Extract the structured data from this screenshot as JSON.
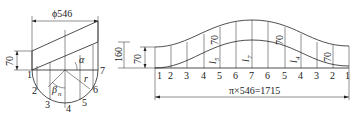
{
  "left_view": {
    "diameter_label": "ϕ546",
    "height_label": "70",
    "angle_alpha": "α",
    "angle_beta": "β",
    "angle_beta_sub": "n",
    "radius_label": "r",
    "points": [
      "1",
      "2",
      "3",
      "4",
      "5",
      "6",
      "7"
    ]
  },
  "development": {
    "height_outer_label": "160",
    "height_inner_label": "70",
    "points": [
      "1",
      "2",
      "3",
      "4",
      "5",
      "6",
      "7",
      "6",
      "5",
      "4",
      "3",
      "2",
      "1"
    ],
    "dims_70": [
      "70",
      "70",
      "70"
    ],
    "lengths": [
      {
        "l": "l",
        "sub": "5"
      },
      {
        "l": "l",
        "sub": "7"
      },
      {
        "l": "l",
        "sub": "4"
      }
    ],
    "total_length_label": "π×546=1715"
  }
}
